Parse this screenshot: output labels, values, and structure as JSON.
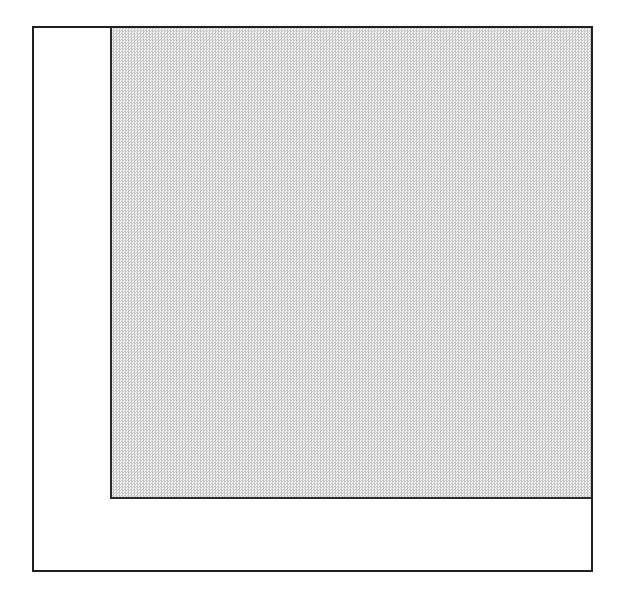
{
  "figure": {
    "background_color": "#ffffff",
    "outer_square": {
      "fill": "#ffffff",
      "border_color": "#1f1f1f"
    },
    "shaded_square": {
      "position": "top-right, flush with outer square's top and right edges",
      "pattern": "halftone-stipple",
      "pattern_dark": "#c6c6c6",
      "pattern_light": "#f3f3f3",
      "average_color": "#dcdcdc",
      "border_color": "#2b2b2b"
    }
  }
}
